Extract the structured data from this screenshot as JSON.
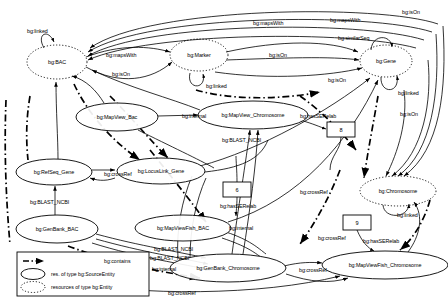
{
  "diagram": {
    "entity_nodes": [
      {
        "id": "bac",
        "label": "bg:BAC",
        "cx": 57,
        "cy": 62,
        "rx": 30,
        "ry": 17
      },
      {
        "id": "marker",
        "label": "bg:Marker",
        "cx": 199,
        "cy": 55,
        "rx": 29,
        "ry": 16
      },
      {
        "id": "gene",
        "label": "bg:Gene",
        "cx": 386,
        "cy": 61,
        "rx": 26,
        "ry": 16
      },
      {
        "id": "chromosome",
        "label": "bg:Chromosome",
        "cx": 398,
        "cy": 191,
        "rx": 38,
        "ry": 15
      }
    ],
    "source_nodes": [
      {
        "id": "mapview_bac",
        "label": "bg:MapView_Bac",
        "cx": 117,
        "cy": 117,
        "rx": 41,
        "ry": 14
      },
      {
        "id": "mapview_chr",
        "label": "bg:MapView_Chromosome",
        "cx": 253,
        "cy": 115,
        "rx": 55,
        "ry": 14
      },
      {
        "id": "refseq_gene",
        "label": "bg:RefSeq_Gene",
        "cx": 54,
        "cy": 172,
        "rx": 38,
        "ry": 13
      },
      {
        "id": "locuslink_gene",
        "label": "bg:LocusLink_Gene",
        "cx": 161,
        "cy": 171,
        "rx": 44,
        "ry": 13
      },
      {
        "id": "genbank_bac",
        "label": "bg:GenBank_BAC",
        "cx": 57,
        "cy": 229,
        "rx": 41,
        "ry": 14
      },
      {
        "id": "mapviewfish_bac",
        "label": "bg:MapViewFish_BAC",
        "cx": 183,
        "cy": 228,
        "rx": 48,
        "ry": 13
      },
      {
        "id": "genbank_chr",
        "label": "bg:GenBank_Chromosome",
        "cx": 228,
        "cy": 268,
        "rx": 58,
        "ry": 14
      },
      {
        "id": "mapviewfish_chr",
        "label": "bg:MapViewFish_Chromosome",
        "cx": 385,
        "cy": 265,
        "rx": 63,
        "ry": 14
      }
    ],
    "box_nodes": [
      {
        "id": "box8",
        "label": "8",
        "x": 327,
        "y": 122,
        "w": 28,
        "h": 15
      },
      {
        "id": "box6",
        "label": "6",
        "x": 223,
        "y": 182,
        "w": 28,
        "h": 15
      },
      {
        "id": "box9",
        "label": "9",
        "x": 343,
        "y": 215,
        "w": 28,
        "h": 15
      }
    ],
    "edge_labels": [
      {
        "id": "e1",
        "text": "bg:linked",
        "x": 27,
        "y": 29
      },
      {
        "id": "e2",
        "text": "bg:mapsWith",
        "x": 106,
        "y": 53
      },
      {
        "id": "e3",
        "text": "bg:isOn",
        "x": 112,
        "y": 72
      },
      {
        "id": "e4",
        "text": "bg:linked",
        "x": 206,
        "y": 84
      },
      {
        "id": "e5",
        "text": "bg:mapsWith",
        "x": 253,
        "y": 21
      },
      {
        "id": "e6",
        "text": "bg:mapsWith",
        "x": 330,
        "y": 18
      },
      {
        "id": "e7",
        "text": "bg:isOn",
        "x": 402,
        "y": 10
      },
      {
        "id": "e8",
        "text": "bg:similarSeq",
        "x": 338,
        "y": 36
      },
      {
        "id": "e9",
        "text": "bg:isOn",
        "x": 269,
        "y": 53
      },
      {
        "id": "e10",
        "text": "bg:isOn",
        "x": 328,
        "y": 78
      },
      {
        "id": "e11",
        "text": "bg:linked",
        "x": 398,
        "y": 91
      },
      {
        "id": "e12",
        "text": "bg:isOn",
        "x": 400,
        "y": 112
      },
      {
        "id": "e13",
        "text": "bg:internal",
        "x": 182,
        "y": 114
      },
      {
        "id": "e14",
        "text": "bg:hasSERelab",
        "x": 300,
        "y": 114
      },
      {
        "id": "e15",
        "text": "bg:BLAST_NCBI",
        "x": 222,
        "y": 138
      },
      {
        "id": "e16",
        "text": "bg:crossRef",
        "x": 104,
        "y": 172
      },
      {
        "id": "e17",
        "text": "bg:BLAST_NCBI",
        "x": 30,
        "y": 200
      },
      {
        "id": "e18",
        "text": "bg:hasSERelab",
        "x": 220,
        "y": 204
      },
      {
        "id": "e19",
        "text": "bg:crossRef",
        "x": 300,
        "y": 190
      },
      {
        "id": "e20",
        "text": "bg:crossRef",
        "x": 318,
        "y": 236
      },
      {
        "id": "e21",
        "text": "bg:linked",
        "x": 397,
        "y": 213
      },
      {
        "id": "e22",
        "text": "bg:hasSERelab",
        "x": 363,
        "y": 239
      },
      {
        "id": "e23",
        "text": "bg:internal",
        "x": 229,
        "y": 226
      },
      {
        "id": "e24",
        "text": "bg:BLAST_NCBI",
        "x": 154,
        "y": 247
      },
      {
        "id": "e25",
        "text": "bg:BLAST_NCBI",
        "x": 150,
        "y": 256
      },
      {
        "id": "e26",
        "text": "bg:internal",
        "x": 152,
        "y": 267
      },
      {
        "id": "e27",
        "text": "bg:crossRef",
        "x": 299,
        "y": 268
      },
      {
        "id": "e28",
        "text": "bg:crossRef",
        "x": 168,
        "y": 291
      }
    ],
    "legend": {
      "contains": "bg:contains",
      "source_entity": "res. of type bg:SourceEntity",
      "entity": "resources of type bg:Entity"
    },
    "colors": {
      "stroke": "#000000",
      "background": "#ffffff",
      "text": "#000000"
    }
  }
}
